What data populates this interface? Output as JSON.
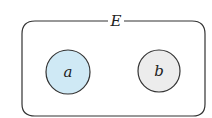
{
  "diagram": {
    "set_label": "E",
    "elements": [
      {
        "label": "a",
        "fill": "#cfe9f5",
        "cx": 68,
        "cy": 72,
        "r": 22
      },
      {
        "label": "b",
        "fill": "#ececec",
        "cx": 159,
        "cy": 71,
        "r": 21
      }
    ],
    "stroke_color": "#333333",
    "background": "#ffffff"
  }
}
